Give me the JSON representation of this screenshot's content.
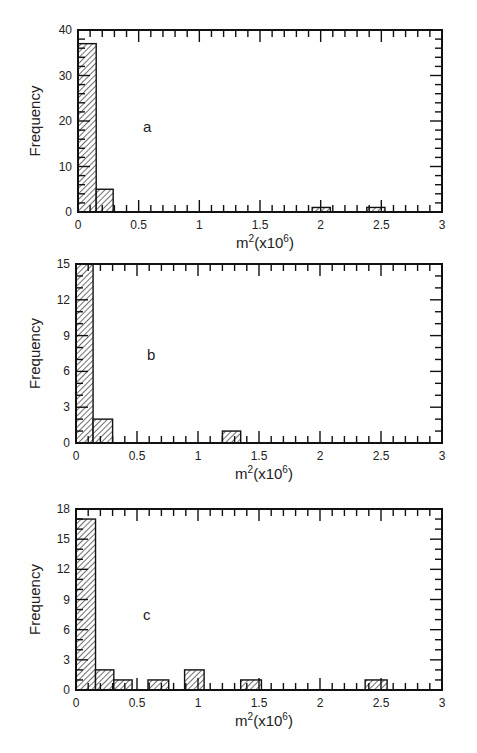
{
  "chart_data": [
    {
      "type": "bar",
      "panel_label": "a",
      "title": "",
      "xlabel": "m2(x106)",
      "xlabel_base": "m",
      "xlabel_sup1": "2",
      "xlabel_mid": "(x10",
      "xlabel_sup2": "6",
      "xlabel_end": ")",
      "ylabel": "Frequency",
      "xlim": [
        0,
        3
      ],
      "ylim": [
        0,
        40
      ],
      "xticks": [
        0,
        0.5,
        1,
        1.5,
        2,
        2.5,
        3
      ],
      "xtick_labels": [
        "0",
        "0.5",
        "1",
        "1.5",
        "2",
        "2.5",
        "3"
      ],
      "yticks": [
        0,
        10,
        20,
        30,
        40
      ],
      "ytick_labels": [
        "0",
        "10",
        "20",
        "30",
        "40"
      ],
      "y_minor_step": 2,
      "x_minor_step": 0.1,
      "grid": false,
      "legend": null,
      "bins": [
        {
          "x0": 0.0,
          "x1": 0.15,
          "value": 37
        },
        {
          "x0": 0.15,
          "x1": 0.29,
          "value": 5
        },
        {
          "x0": 1.93,
          "x1": 2.08,
          "value": 1
        },
        {
          "x0": 2.38,
          "x1": 2.53,
          "value": 1
        }
      ],
      "categories": [
        "0-0.15",
        "0.15-0.29",
        "1.93-2.08",
        "2.38-2.53"
      ],
      "values": [
        37,
        5,
        1,
        1
      ]
    },
    {
      "type": "bar",
      "panel_label": "b",
      "title": "",
      "xlabel": "m2(x106)",
      "xlabel_base": "m",
      "xlabel_sup1": "2",
      "xlabel_mid": "(x10",
      "xlabel_sup2": "6",
      "xlabel_end": ")",
      "ylabel": "Frequency",
      "xlim": [
        0,
        3
      ],
      "ylim": [
        0,
        15
      ],
      "xticks": [
        0,
        0.5,
        1,
        1.5,
        2,
        2.5,
        3
      ],
      "xtick_labels": [
        "0",
        "0.5",
        "1",
        "1.5",
        "2",
        "2.5",
        "3"
      ],
      "yticks": [
        0,
        3,
        6,
        9,
        12,
        15
      ],
      "ytick_labels": [
        "0",
        "3",
        "6",
        "9",
        "12",
        "15"
      ],
      "y_minor_step": 1,
      "x_minor_step": 0.1,
      "grid": false,
      "legend": null,
      "bins": [
        {
          "x0": 0.0,
          "x1": 0.14,
          "value": 15
        },
        {
          "x0": 0.14,
          "x1": 0.3,
          "value": 2
        },
        {
          "x0": 1.2,
          "x1": 1.35,
          "value": 1
        }
      ],
      "categories": [
        "0-0.14",
        "0.14-0.3",
        "1.2-1.35"
      ],
      "values": [
        15,
        2,
        1
      ]
    },
    {
      "type": "bar",
      "panel_label": "c",
      "title": "",
      "xlabel": "m2(x106)",
      "xlabel_base": "m",
      "xlabel_sup1": "2",
      "xlabel_mid": "(x10",
      "xlabel_sup2": "6",
      "xlabel_end": ")",
      "ylabel": "Frequency",
      "xlim": [
        0,
        3
      ],
      "ylim": [
        0,
        18
      ],
      "xticks": [
        0,
        0.5,
        1,
        1.5,
        2,
        2.5,
        3
      ],
      "xtick_labels": [
        "0",
        "0.5",
        "1",
        "1.5",
        "2",
        "2.5",
        "3"
      ],
      "yticks": [
        0,
        3,
        6,
        9,
        12,
        15,
        18
      ],
      "ytick_labels": [
        "0",
        "3",
        "6",
        "9",
        "12",
        "15",
        "18"
      ],
      "y_minor_step": 1,
      "x_minor_step": 0.1,
      "grid": false,
      "legend": null,
      "bins": [
        {
          "x0": 0.0,
          "x1": 0.16,
          "value": 17
        },
        {
          "x0": 0.16,
          "x1": 0.31,
          "value": 2
        },
        {
          "x0": 0.31,
          "x1": 0.46,
          "value": 1
        },
        {
          "x0": 0.59,
          "x1": 0.76,
          "value": 1
        },
        {
          "x0": 0.89,
          "x1": 1.05,
          "value": 2
        },
        {
          "x0": 1.35,
          "x1": 1.52,
          "value": 1
        },
        {
          "x0": 2.37,
          "x1": 2.55,
          "value": 1
        }
      ],
      "categories": [
        "0-0.16",
        "0.16-0.31",
        "0.31-0.46",
        "0.59-0.76",
        "0.89-1.05",
        "1.35-1.52",
        "2.37-2.55"
      ],
      "values": [
        17,
        2,
        1,
        1,
        2,
        1,
        1
      ]
    }
  ],
  "layout": {
    "panels": [
      {
        "left": 78,
        "right": 442,
        "top": 30,
        "bottom": 212,
        "label_x": 143,
        "label_y": 132
      },
      {
        "left": 76,
        "right": 442,
        "top": 264,
        "bottom": 443,
        "label_x": 147,
        "label_y": 360
      },
      {
        "left": 76,
        "right": 442,
        "top": 509,
        "bottom": 690,
        "label_x": 143,
        "label_y": 620
      }
    ],
    "colors": {
      "axis": "#111111",
      "hatch": "#222222",
      "bar_fill": "#ffffff",
      "text": "#222222"
    }
  }
}
